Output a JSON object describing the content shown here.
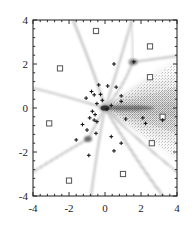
{
  "chart_data": {
    "type": "scatter",
    "title": "",
    "xlabel": "",
    "ylabel": "",
    "xlim": [
      -4,
      4
    ],
    "ylim": [
      -4,
      4
    ],
    "grid": false,
    "legend": null,
    "xticks": [
      -4,
      -2,
      0,
      2,
      4
    ],
    "yticks": [
      -4,
      -2,
      0,
      2,
      4
    ],
    "xtick_labels": [
      "-4",
      "-2",
      "0",
      "2",
      "4"
    ],
    "ytick_labels": [
      "-4",
      "-2",
      "0",
      "2",
      "4"
    ],
    "minor_ticks_per_interval": 4,
    "series": [
      {
        "name": "square-markers",
        "marker": "open-square",
        "color": "#555555",
        "points": [
          [
            -0.5,
            3.5
          ],
          [
            2.5,
            2.8
          ],
          [
            -2.5,
            1.8
          ],
          [
            2.5,
            1.4
          ],
          [
            3.2,
            -0.4
          ],
          [
            -3.1,
            -0.7
          ],
          [
            2.6,
            -1.6
          ],
          [
            1.0,
            -3.0
          ],
          [
            -2.0,
            -3.3
          ]
        ]
      },
      {
        "name": "plus-markers",
        "marker": "plus",
        "color": "#1a1a1a",
        "points": [
          [
            0.5,
            2.0
          ],
          [
            1.6,
            2.1
          ],
          [
            -0.35,
            1.05
          ],
          [
            0.15,
            1.0
          ],
          [
            0.62,
            0.95
          ],
          [
            -0.75,
            0.75
          ],
          [
            -0.6,
            0.6
          ],
          [
            -0.25,
            0.62
          ],
          [
            0.9,
            0.55
          ],
          [
            0.9,
            0.3
          ],
          [
            -1.05,
            0.45
          ],
          [
            -0.45,
            0.2
          ],
          [
            0.35,
            0.12
          ],
          [
            -0.7,
            -0.15
          ],
          [
            -0.55,
            -0.3
          ],
          [
            -0.85,
            -0.45
          ],
          [
            -0.6,
            -0.55
          ],
          [
            -0.45,
            -0.62
          ],
          [
            1.15,
            -0.5
          ],
          [
            2.1,
            -0.45
          ],
          [
            3.2,
            -0.55
          ],
          [
            -1.25,
            -0.75
          ],
          [
            -1.0,
            -1.0
          ],
          [
            -0.5,
            -1.15
          ],
          [
            0.35,
            -1.3
          ],
          [
            -1.6,
            -1.45
          ],
          [
            0.9,
            -1.6
          ],
          [
            0.5,
            -1.95
          ],
          [
            -0.9,
            -2.15
          ],
          [
            2.25,
            -0.7
          ],
          [
            0.1,
            -0.05
          ],
          [
            -0.15,
            0.35
          ]
        ]
      }
    ],
    "structures": {
      "description": "radiating ray / density-fan pattern converging at origin",
      "primary_vertex": [
        0.0,
        0.0
      ],
      "secondary_vertex": [
        -0.62,
        -1.42
      ],
      "tertiary_vertex": [
        1.55,
        2.05
      ],
      "fan_direction": "rightward",
      "fan_color": "#4a4a4a",
      "ray_color": "#666666"
    }
  },
  "axes": {
    "frame_color": "#1a1a1a",
    "background": "#ffffff"
  }
}
